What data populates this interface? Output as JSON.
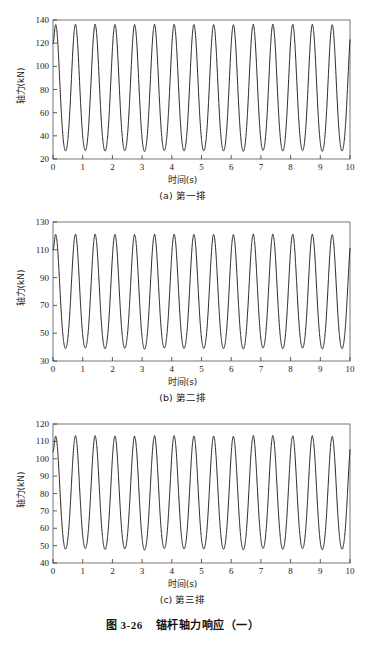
{
  "figure": {
    "caption_number": "图 3-26",
    "caption_text": "锚杆轴力响应（一）"
  },
  "panels": [
    {
      "id": "a",
      "subcaption": "(a) 第一排",
      "xlabel": "时间(s)",
      "ylabel": "轴力(kN)"
    },
    {
      "id": "b",
      "subcaption": "(b) 第二排",
      "xlabel": "时间(s)",
      "ylabel": "轴力(kN)"
    },
    {
      "id": "c",
      "subcaption": "(c) 第三排",
      "xlabel": "时间(s)",
      "ylabel": "轴力(kN)"
    }
  ],
  "chart_data": [
    {
      "type": "line",
      "title": "(a) 第一排",
      "xlabel": "时间(s)",
      "ylabel": "轴力(kN)",
      "xlim": [
        0,
        10
      ],
      "ylim": [
        20,
        140
      ],
      "xticks": [
        0,
        1,
        2,
        3,
        4,
        5,
        6,
        7,
        8,
        9,
        10
      ],
      "yticks": [
        20,
        40,
        60,
        80,
        100,
        120,
        140
      ],
      "grid": false,
      "legend": null,
      "line_color": "#1a1a1a",
      "waveform": {
        "start_value": 120,
        "mean": 81.5,
        "amplitude": 54.5,
        "period": 0.665,
        "phase_peak_t": 0.09,
        "peak_value": 136,
        "trough_value": 27,
        "n_cycles": 15,
        "end_value": 72
      }
    },
    {
      "type": "line",
      "title": "(b) 第二排",
      "xlabel": "时间(s)",
      "ylabel": "轴力(kN)",
      "xlim": [
        0,
        10
      ],
      "ylim": [
        30,
        130
      ],
      "xticks": [
        0,
        1,
        2,
        3,
        4,
        5,
        6,
        7,
        8,
        9,
        10
      ],
      "yticks": [
        30,
        50,
        70,
        90,
        110,
        130
      ],
      "grid": false,
      "legend": null,
      "line_color": "#1a1a1a",
      "waveform": {
        "start_value": 110,
        "mean": 80,
        "amplitude": 41,
        "period": 0.665,
        "phase_peak_t": 0.09,
        "peak_value": 121,
        "trough_value": 39,
        "n_cycles": 15,
        "end_value": 78
      }
    },
    {
      "type": "line",
      "title": "(c) 第三排",
      "xlabel": "时间(s)",
      "ylabel": "轴力(kN)",
      "xlim": [
        0,
        10
      ],
      "ylim": [
        40,
        120
      ],
      "xticks": [
        0,
        1,
        2,
        3,
        4,
        5,
        6,
        7,
        8,
        9,
        10
      ],
      "yticks": [
        40,
        50,
        60,
        70,
        80,
        90,
        100,
        110,
        120
      ],
      "grid": false,
      "legend": null,
      "line_color": "#1a1a1a",
      "waveform": {
        "start_value": 104,
        "mean": 80.5,
        "amplitude": 32.5,
        "period": 0.665,
        "phase_peak_t": 0.09,
        "peak_value": 113,
        "trough_value": 48,
        "n_cycles": 15,
        "end_value": 80
      }
    }
  ]
}
